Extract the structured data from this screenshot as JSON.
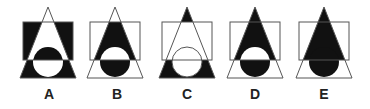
{
  "colors": {
    "fill": "#111111",
    "stroke": "#555555",
    "background": "#ffffff"
  },
  "options": [
    {
      "label": "A",
      "description": "Square outside triangle black; triangle inside square white; circle top black; circle bottom white; triangle base outside circle black; tip white"
    },
    {
      "label": "B",
      "description": "Triangle inside square black; circle top white; circle bottom black; rest white"
    },
    {
      "label": "C",
      "description": "Tip black; square area outlines only; triangle base outside circle black; circle bottom white"
    },
    {
      "label": "D",
      "description": "Tip and triangle inside square black; circle top white; circle bottom black; base outside circle white"
    },
    {
      "label": "E",
      "description": "Triangle and circle fully black forming a teardrop; base outside circle white"
    }
  ]
}
